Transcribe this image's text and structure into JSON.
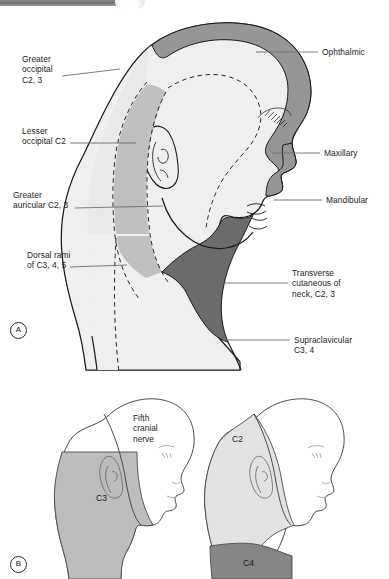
{
  "figure": {
    "panels": [
      {
        "id": "A",
        "badge_label": "A"
      },
      {
        "id": "B",
        "badge_label": "B"
      }
    ]
  },
  "panel_a": {
    "badge": "A",
    "labels_left": [
      {
        "name": "greater-occipital",
        "text": "Greater\noccipital\nC2, 3"
      },
      {
        "name": "lesser-occipital",
        "text": "Lesser\noccipital C2"
      },
      {
        "name": "greater-auricular",
        "text": "Greater\nauricular C2, 3"
      },
      {
        "name": "dorsal-rami",
        "text": "Dorsal rami\nof C3, 4, 5"
      }
    ],
    "labels_right": [
      {
        "name": "ophthalmic",
        "text": "Ophthalmic"
      },
      {
        "name": "maxillary",
        "text": "Maxillary"
      },
      {
        "name": "mandibular",
        "text": "Mandibular"
      },
      {
        "name": "transverse-cutaneous-of-neck",
        "text": "Transverse\ncutaneous of\nneck, C2, 3"
      },
      {
        "name": "supraclavicular",
        "text": "Supraclavicular\nC3, 4"
      }
    ]
  },
  "panel_b": {
    "badge": "B",
    "head_left": {
      "caption": "Fifth\ncranial\nnerve",
      "region_label": "C3"
    },
    "head_right": {
      "region_label_upper": "C2",
      "region_label_lower": "C4"
    }
  },
  "colors": {
    "ophthalmic_fill": "#969696",
    "maxillary_fill": "#969696",
    "transverse_cutaneous_fill": "#6b6b6b",
    "c4_fill": "#868686",
    "mid_gray_fill": "#c0c0c0",
    "light_fill": "#e9e9e9",
    "very_light_fill": "#efefef",
    "outline": "#1b1b1b",
    "white": "#ffffff"
  }
}
